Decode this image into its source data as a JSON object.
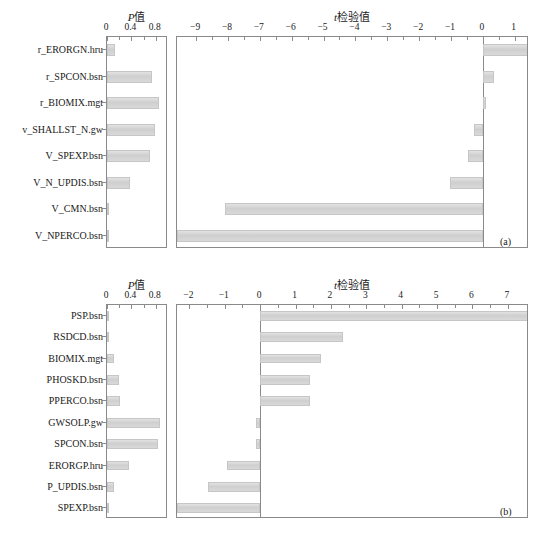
{
  "figure": {
    "background": "#ffffff",
    "bar_color": "#d4d4d4",
    "axis_color": "#8a8a8a"
  },
  "chart_data": [
    {
      "type": "bar",
      "orientation": "horizontal",
      "panel": "(a)",
      "title": "",
      "subplots": [
        {
          "name": "p-value",
          "xlabel": "P值",
          "xlabel_parts": {
            "italic": "P",
            "rest": "值"
          },
          "xlim": [
            0,
            1.0
          ],
          "xticks": [
            0,
            0.4,
            0.8
          ],
          "xticklabels": [
            "0",
            "0.4",
            "0.8"
          ],
          "grid": false,
          "categories": [
            "r_ERORGN.hru",
            "r_SPCON.bsn",
            "r_BIOMIX.mgt",
            "v_SHALLST_N.gw",
            "V_SPEXP.bsn",
            "V_N_UPDIS.bsn",
            "V_CMN.bsn",
            "V_NPERCO.bsn"
          ],
          "values": [
            0.13,
            0.73,
            0.86,
            0.79,
            0.71,
            0.38,
            0.04,
            0.04
          ]
        },
        {
          "name": "t-test",
          "xlabel": "t检验值",
          "xlabel_parts": {
            "italic": "t",
            "rest": "检验值"
          },
          "xlim": [
            -9.6,
            1.45
          ],
          "xticks": [
            -9,
            -8,
            -7,
            -6,
            -5,
            -4,
            -3,
            -2,
            -1,
            0,
            1
          ],
          "xticklabels": [
            "−9",
            "−8",
            "−7",
            "−6",
            "−5",
            "−4",
            "−3",
            "−2",
            "−1",
            "0",
            "1"
          ],
          "grid": false,
          "categories": [
            "r_ERORGN.hru",
            "r_SPCON.bsn",
            "r_BIOMIX.mgt",
            "v_SHALLST_N.gw",
            "V_SPEXP.bsn",
            "V_N_UPDIS.bsn",
            "V_CMN.bsn",
            "V_NPERCO.bsn"
          ],
          "values": [
            1.45,
            0.35,
            0.1,
            -0.28,
            -0.45,
            -1.02,
            -8.1,
            -9.6
          ]
        }
      ]
    },
    {
      "type": "bar",
      "orientation": "horizontal",
      "panel": "(b)",
      "title": "",
      "subplots": [
        {
          "name": "p-value",
          "xlabel": "P值",
          "xlabel_parts": {
            "italic": "P",
            "rest": "值"
          },
          "xlim": [
            0,
            1.0
          ],
          "xticks": [
            0,
            0.4,
            0.8
          ],
          "xticklabels": [
            "0",
            "0.4",
            "0.8"
          ],
          "grid": false,
          "categories": [
            "PSP.bsn",
            "RSDCD.bsn",
            "BIOMIX.mgt",
            "PHOSKD.bsn",
            "PPERCO.bsn",
            "GWSOLP.gw",
            "SPCON.bsn",
            "ERORGP.hru",
            "P_UPDIS.bsn",
            "SPEXP.bsn"
          ],
          "values": [
            0.01,
            0.04,
            0.11,
            0.19,
            0.21,
            0.87,
            0.83,
            0.36,
            0.12,
            0.03
          ]
        },
        {
          "name": "t-test",
          "xlabel": "t检验值",
          "xlabel_parts": {
            "italic": "t",
            "rest": "检验值"
          },
          "xlim": [
            -2.35,
            7.6
          ],
          "xticks": [
            -2,
            -1,
            0,
            1,
            2,
            3,
            4,
            5,
            6,
            7
          ],
          "xticklabels": [
            "−2",
            "−1",
            "0",
            "1",
            "2",
            "3",
            "4",
            "5",
            "6",
            "7"
          ],
          "grid": false,
          "categories": [
            "PSP.bsn",
            "RSDCD.bsn",
            "BIOMIX.mgt",
            "PHOSKD.bsn",
            "PPERCO.bsn",
            "GWSOLP.gw",
            "SPCON.bsn",
            "ERORGP.hru",
            "P_UPDIS.bsn",
            "SPEXP.bsn"
          ],
          "values": [
            7.6,
            2.35,
            1.72,
            1.4,
            1.4,
            -0.13,
            -0.13,
            -0.95,
            -1.48,
            -2.35
          ]
        }
      ]
    }
  ]
}
